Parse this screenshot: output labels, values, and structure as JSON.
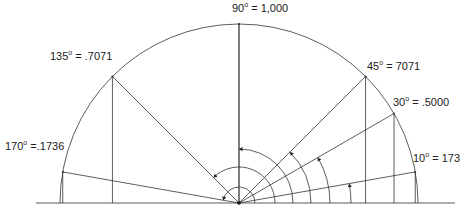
{
  "diagram": {
    "center": [
      239,
      203
    ],
    "radius": 179,
    "stroke_color": "#333333",
    "baseline": {
      "x1": 36,
      "x2": 455,
      "y": 203
    },
    "angles": [
      {
        "deg": 10,
        "label_deg": "10",
        "label_val": "= 173",
        "lx": 413,
        "ly": 162
      },
      {
        "deg": 30,
        "label_deg": "30",
        "label_val": "= .5000",
        "lx": 393,
        "ly": 106
      },
      {
        "deg": 45,
        "label_deg": "45",
        "label_val": "=  7071",
        "lx": 367,
        "ly": 70
      },
      {
        "deg": 90,
        "label_deg": "90",
        "label_val": "= 1,000",
        "lx": 232,
        "ly": 12
      },
      {
        "deg": 135,
        "label_deg": "135",
        "label_val": "= .7071",
        "lx": 50,
        "ly": 60
      },
      {
        "deg": 170,
        "label_deg": "170",
        "label_val": "=.1736",
        "lx": 5,
        "ly": 150
      }
    ],
    "inner_arcs": [
      {
        "r": 16,
        "to_deg": 170
      },
      {
        "r": 36,
        "to_deg": 135
      },
      {
        "r": 54,
        "to_deg": 90
      },
      {
        "r": 72,
        "to_deg": 45
      },
      {
        "r": 91,
        "to_deg": 30
      },
      {
        "r": 112,
        "to_deg": 10
      }
    ]
  }
}
